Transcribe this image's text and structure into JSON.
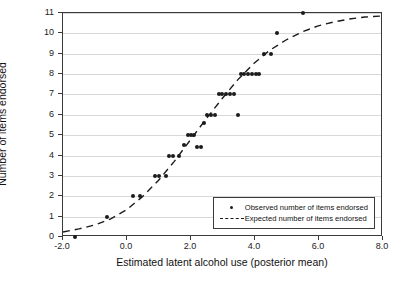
{
  "chart_data": {
    "type": "scatter",
    "title": "",
    "xlabel": "Estimated latent alcohol use (posterior mean)",
    "ylabel": "Number of items endorsed",
    "xlim": [
      -2.0,
      8.0
    ],
    "ylim": [
      0,
      11
    ],
    "xticks": [
      -2.0,
      0.0,
      2.0,
      4.0,
      6.0,
      8.0
    ],
    "xtick_labels": [
      "-2.0",
      "0.0",
      "2.0",
      "4.0",
      "6.0",
      "8.0"
    ],
    "yticks": [
      0,
      1,
      2,
      3,
      4,
      5,
      6,
      7,
      8,
      9,
      10,
      11
    ],
    "ytick_labels": [
      "0",
      "1",
      "2",
      "3",
      "4",
      "5",
      "6",
      "7",
      "8",
      "9",
      "10",
      "11"
    ],
    "grid": "horizontal",
    "legend_position": "lower-right",
    "series": [
      {
        "name": "Observed number of items endorsed",
        "marker": "dot",
        "color": "#1b1b1b",
        "points": [
          [
            -1.62,
            0.0
          ],
          [
            -0.62,
            1.0
          ],
          [
            0.18,
            2.0
          ],
          [
            0.42,
            2.0
          ],
          [
            0.86,
            3.0
          ],
          [
            1.0,
            3.0
          ],
          [
            1.22,
            3.0
          ],
          [
            1.3,
            4.0
          ],
          [
            1.45,
            4.0
          ],
          [
            1.62,
            4.0
          ],
          [
            1.78,
            4.5
          ],
          [
            1.9,
            5.0
          ],
          [
            2.0,
            5.0
          ],
          [
            2.1,
            5.0
          ],
          [
            2.2,
            4.4
          ],
          [
            2.3,
            4.4
          ],
          [
            2.42,
            5.6
          ],
          [
            2.5,
            6.0
          ],
          [
            2.62,
            6.0
          ],
          [
            2.74,
            6.0
          ],
          [
            2.86,
            7.0
          ],
          [
            2.98,
            7.0
          ],
          [
            3.1,
            7.0
          ],
          [
            3.22,
            7.0
          ],
          [
            3.34,
            7.0
          ],
          [
            3.46,
            6.0
          ],
          [
            3.55,
            8.0
          ],
          [
            3.66,
            8.0
          ],
          [
            3.78,
            8.0
          ],
          [
            3.9,
            8.0
          ],
          [
            4.02,
            8.0
          ],
          [
            4.14,
            8.0
          ],
          [
            4.28,
            9.0
          ],
          [
            4.5,
            9.0
          ],
          [
            4.7,
            10.0
          ],
          [
            5.5,
            11.0
          ]
        ]
      },
      {
        "name": "Expected number of items endorsed",
        "marker": "dashed-line",
        "color": "#1b1b1b",
        "x": [
          -2.0,
          -1.5,
          -1.0,
          -0.5,
          0.0,
          0.5,
          1.0,
          1.5,
          2.0,
          2.5,
          3.0,
          3.5,
          4.0,
          4.5,
          5.0,
          5.5,
          6.0,
          6.5,
          7.0,
          7.5,
          8.0
        ],
        "y": [
          0.15,
          0.3,
          0.5,
          0.8,
          1.25,
          1.9,
          2.7,
          3.65,
          4.7,
          5.75,
          6.75,
          7.7,
          8.5,
          9.15,
          9.65,
          10.05,
          10.35,
          10.55,
          10.7,
          10.8,
          10.85
        ]
      }
    ],
    "legend": [
      {
        "label": "Observed number of items endorsed",
        "key": "dot"
      },
      {
        "label": "Expected number of items endorsed",
        "key": "dash"
      }
    ]
  }
}
